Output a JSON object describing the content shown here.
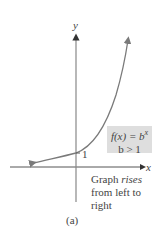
{
  "axes": {
    "x_label": "x",
    "y_label": "y"
  },
  "curve": {
    "color": "#7a7a7a",
    "point_label": "1"
  },
  "formula_box": {
    "function": "f(x) = b",
    "exponent": "x",
    "condition": "b > 1"
  },
  "caption": {
    "prefix": "Graph ",
    "emphasis": "rises",
    "rest_line1": "",
    "line2": "from left to",
    "line3": "right"
  },
  "figure_label": "(a)"
}
